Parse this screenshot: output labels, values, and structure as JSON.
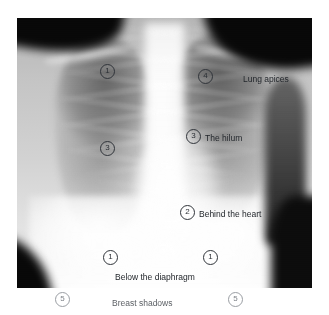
{
  "figure": {
    "kind": "chest-radiograph-annotated",
    "image_region": {
      "left": 17,
      "top": 18,
      "width": 295,
      "height": 270
    }
  },
  "annotations": {
    "markers": [
      {
        "id": "m1",
        "number": "1",
        "x": 107,
        "y": 71,
        "area": "xray",
        "refers_to": "Lung apices - left"
      },
      {
        "id": "m2",
        "number": "4",
        "x": 205,
        "y": 76,
        "area": "xray",
        "refers_to": "Lung apices - right"
      },
      {
        "id": "m3",
        "number": "3",
        "x": 107,
        "y": 148,
        "area": "xray",
        "refers_to": "The hilum - left"
      },
      {
        "id": "m4",
        "number": "3",
        "x": 193,
        "y": 136,
        "area": "xray",
        "refers_to": "The hilum - right"
      },
      {
        "id": "m5",
        "number": "2",
        "x": 187,
        "y": 212,
        "area": "xray",
        "refers_to": "Behind the heart"
      },
      {
        "id": "m6",
        "number": "1",
        "x": 110,
        "y": 257,
        "area": "xray",
        "refers_to": "Below the diaphragm - left"
      },
      {
        "id": "m7",
        "number": "1",
        "x": 210,
        "y": 257,
        "area": "xray",
        "refers_to": "Below the diaphragm - right"
      },
      {
        "id": "m8",
        "number": "5",
        "x": 62,
        "y": 299,
        "area": "page",
        "refers_to": "Breast shadows - left"
      },
      {
        "id": "m9",
        "number": "5",
        "x": 235,
        "y": 299,
        "area": "page",
        "refers_to": "Breast shadows - right"
      }
    ],
    "labels": [
      {
        "id": "l1",
        "text": "Lung apices",
        "x": 243,
        "y": 74,
        "area": "xray"
      },
      {
        "id": "l2",
        "text": "The hilum",
        "x": 205,
        "y": 133,
        "area": "xray"
      },
      {
        "id": "l3",
        "text": "Behind the heart",
        "x": 199,
        "y": 209,
        "area": "xray"
      },
      {
        "id": "l4",
        "text": "Below the diaphragm",
        "x": 115,
        "y": 272,
        "area": "xray"
      },
      {
        "id": "l5",
        "text": "Breast shadows",
        "x": 115,
        "y": 299,
        "area": "page"
      }
    ]
  },
  "colors": {
    "page_background": "#ffffff",
    "marker_stroke": "#30343a",
    "marker_stroke_light": "#9a9ea3",
    "label_text": "#23272c",
    "label_text_light": "#5d6166"
  }
}
